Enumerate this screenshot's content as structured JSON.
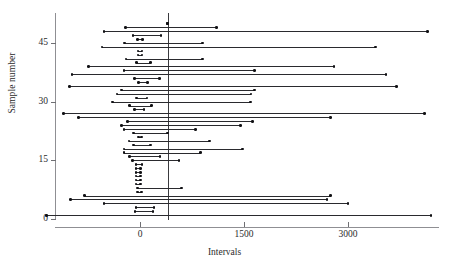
{
  "axes": {
    "ylabel": "Sample number",
    "xlabel": "Intervals",
    "faint_header": "",
    "x_ticks": [
      "0",
      "1500",
      "3000"
    ],
    "y_ticks": [
      "0",
      "15",
      "30",
      "45"
    ]
  },
  "chart_data": {
    "type": "line",
    "title": "",
    "subtitle": "",
    "xlabel": "Intervals",
    "ylabel": "Sample number",
    "xlim": [
      -600,
      4400
    ],
    "ylim": [
      -1,
      51
    ],
    "x_ticks": [
      0,
      1500,
      3000
    ],
    "y_ticks": [
      0,
      15,
      30,
      45
    ],
    "grid": false,
    "legend": null,
    "reference_line": {
      "orientation": "vertical",
      "x": 400,
      "label": ""
    },
    "series": [
      {
        "name": "interval",
        "sample": 50,
        "lower": 400,
        "upper": 400,
        "point": 400
      },
      {
        "name": "interval",
        "sample": 49,
        "lower": -210,
        "upper": 1100,
        "point": 400
      },
      {
        "name": "interval",
        "sample": 48,
        "lower": -520,
        "upper": 4150,
        "point": 400
      },
      {
        "name": "interval",
        "sample": 47,
        "lower": -100,
        "upper": 300,
        "point": 400
      },
      {
        "name": "interval",
        "sample": 46,
        "lower": -40,
        "upper": 40,
        "point": 400
      },
      {
        "name": "interval",
        "sample": 45,
        "lower": -220,
        "upper": 900,
        "point": 400
      },
      {
        "name": "interval",
        "sample": 44,
        "lower": -550,
        "upper": 3400,
        "point": 400
      },
      {
        "name": "interval",
        "sample": 43,
        "lower": -30,
        "upper": 30,
        "point": 400
      },
      {
        "name": "interval",
        "sample": 42,
        "lower": -30,
        "upper": 30,
        "point": 400
      },
      {
        "name": "interval",
        "sample": 41,
        "lower": -200,
        "upper": 900,
        "point": 400
      },
      {
        "name": "interval",
        "sample": 40,
        "lower": -50,
        "upper": 150,
        "point": 400
      },
      {
        "name": "interval",
        "sample": 39,
        "lower": -740,
        "upper": 2800,
        "point": 400
      },
      {
        "name": "interval",
        "sample": 38,
        "lower": -230,
        "upper": 1650,
        "point": 400
      },
      {
        "name": "interval",
        "sample": 37,
        "lower": -980,
        "upper": 3550,
        "point": 400
      },
      {
        "name": "interval",
        "sample": 36,
        "lower": -80,
        "upper": 280,
        "point": 400
      },
      {
        "name": "interval",
        "sample": 35,
        "lower": -20,
        "upper": 110,
        "point": 400
      },
      {
        "name": "interval",
        "sample": 34,
        "lower": -1020,
        "upper": 3700,
        "point": 400
      },
      {
        "name": "interval",
        "sample": 33,
        "lower": -270,
        "upper": 1650,
        "point": 400
      },
      {
        "name": "interval",
        "sample": 32,
        "lower": -330,
        "upper": 1600,
        "point": 400
      },
      {
        "name": "interval",
        "sample": 31,
        "lower": -50,
        "upper": 100,
        "point": 400
      },
      {
        "name": "interval",
        "sample": 30,
        "lower": -400,
        "upper": 1590,
        "point": 400
      },
      {
        "name": "interval",
        "sample": 29,
        "lower": -150,
        "upper": 170,
        "point": 400
      },
      {
        "name": "interval",
        "sample": 28,
        "lower": -80,
        "upper": 60,
        "point": 400
      },
      {
        "name": "interval",
        "sample": 27,
        "lower": -1100,
        "upper": 4100,
        "point": 400
      },
      {
        "name": "interval",
        "sample": 26,
        "lower": -890,
        "upper": 2750,
        "point": 400
      },
      {
        "name": "interval",
        "sample": 25,
        "lower": -180,
        "upper": 1620,
        "point": 400
      },
      {
        "name": "interval",
        "sample": 24,
        "lower": -270,
        "upper": 1450,
        "point": 400
      },
      {
        "name": "interval",
        "sample": 23,
        "lower": -230,
        "upper": 800,
        "point": 400
      },
      {
        "name": "interval",
        "sample": 22,
        "lower": -90,
        "upper": 400,
        "point": 400
      },
      {
        "name": "interval",
        "sample": 21,
        "lower": -20,
        "upper": 20,
        "point": 400
      },
      {
        "name": "interval",
        "sample": 20,
        "lower": -160,
        "upper": 1000,
        "point": 400
      },
      {
        "name": "interval",
        "sample": 19,
        "lower": -90,
        "upper": 150,
        "point": 400
      },
      {
        "name": "interval",
        "sample": 18,
        "lower": -230,
        "upper": 1480,
        "point": 400
      },
      {
        "name": "interval",
        "sample": 17,
        "lower": -230,
        "upper": 870,
        "point": 400
      },
      {
        "name": "interval",
        "sample": 16,
        "lower": -150,
        "upper": 290,
        "point": 400
      },
      {
        "name": "interval",
        "sample": 15,
        "lower": -110,
        "upper": 560,
        "point": 400
      },
      {
        "name": "interval",
        "sample": 14,
        "lower": -60,
        "upper": 30,
        "point": 400
      },
      {
        "name": "interval",
        "sample": 13,
        "lower": -60,
        "upper": 10,
        "point": 400
      },
      {
        "name": "interval",
        "sample": 12,
        "lower": -60,
        "upper": 10,
        "point": 400
      },
      {
        "name": "interval",
        "sample": 11,
        "lower": -60,
        "upper": 10,
        "point": 400
      },
      {
        "name": "interval",
        "sample": 10,
        "lower": -60,
        "upper": 10,
        "point": 400
      },
      {
        "name": "interval",
        "sample": 9,
        "lower": -60,
        "upper": 10,
        "point": 400
      },
      {
        "name": "interval",
        "sample": 8,
        "lower": -40,
        "upper": 600,
        "point": 400
      },
      {
        "name": "interval",
        "sample": 7,
        "lower": -40,
        "upper": 20,
        "point": 400
      },
      {
        "name": "interval",
        "sample": 6,
        "lower": -800,
        "upper": 2750,
        "point": 400
      },
      {
        "name": "interval",
        "sample": 5,
        "lower": -1000,
        "upper": 2700,
        "point": 400
      },
      {
        "name": "interval",
        "sample": 4,
        "lower": -520,
        "upper": 3000,
        "point": 400
      },
      {
        "name": "interval",
        "sample": 3,
        "lower": -60,
        "upper": 200,
        "point": 400
      },
      {
        "name": "interval",
        "sample": 2,
        "lower": -70,
        "upper": 190,
        "point": 400
      },
      {
        "name": "interval",
        "sample": 1,
        "lower": -1350,
        "upper": 4200,
        "point": 400
      }
    ]
  }
}
